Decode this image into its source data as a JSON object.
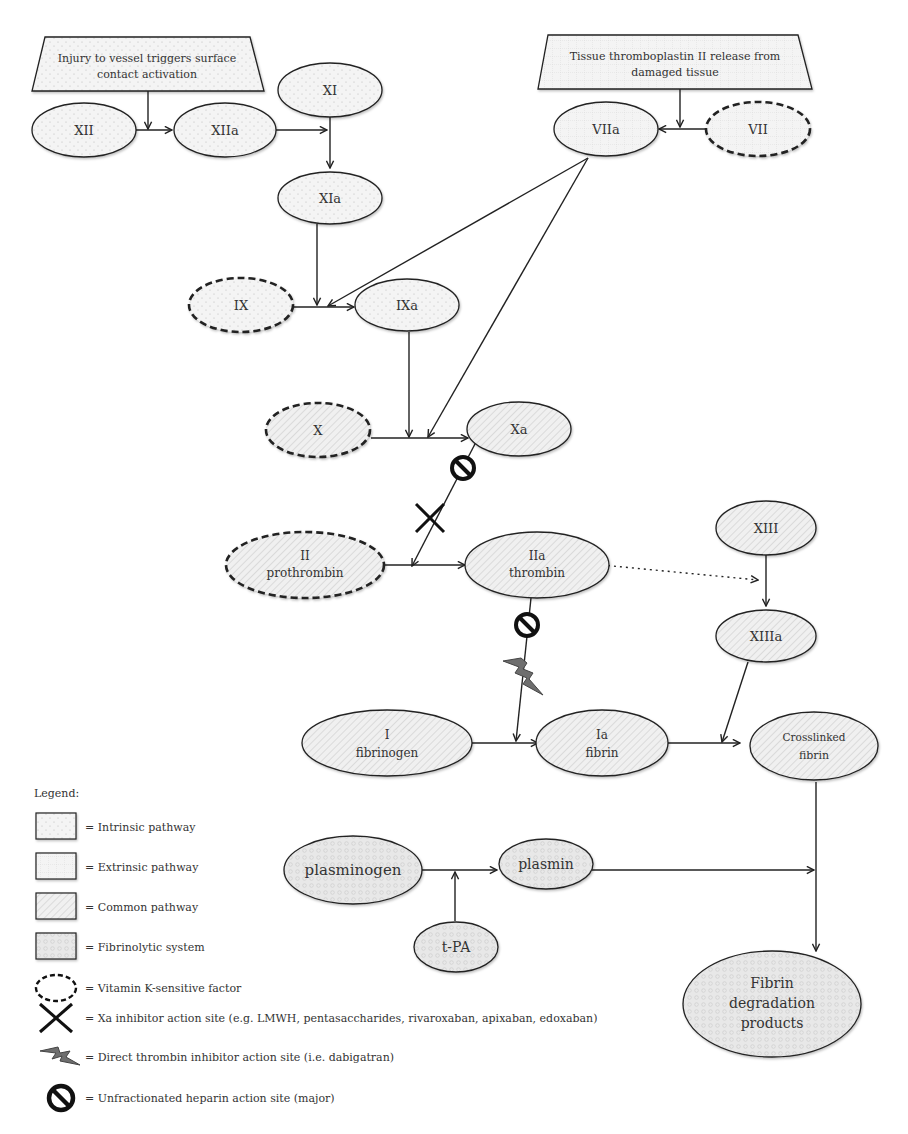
{
  "diagram": {
    "boxes": [
      {
        "id": "intrinsic-trigger",
        "pathway": "intrinsic",
        "lines": [
          "Injury to vessel triggers surface",
          "contact activation"
        ]
      },
      {
        "id": "extrinsic-trigger",
        "pathway": "extrinsic",
        "lines": [
          "Tissue thromboplastin II release from",
          "damaged tissue"
        ]
      }
    ],
    "nodes": [
      {
        "id": "XII",
        "lines": [
          "XII"
        ],
        "pathway": "intrinsic",
        "vitamin_k": false
      },
      {
        "id": "XIIa",
        "lines": [
          "XIIa"
        ],
        "pathway": "intrinsic",
        "vitamin_k": false
      },
      {
        "id": "XI",
        "lines": [
          "XI"
        ],
        "pathway": "intrinsic",
        "vitamin_k": false
      },
      {
        "id": "XIa",
        "lines": [
          "XIa"
        ],
        "pathway": "intrinsic",
        "vitamin_k": false
      },
      {
        "id": "IX",
        "lines": [
          "IX"
        ],
        "pathway": "intrinsic",
        "vitamin_k": true
      },
      {
        "id": "IXa",
        "lines": [
          "IXa"
        ],
        "pathway": "intrinsic",
        "vitamin_k": false
      },
      {
        "id": "VIIa",
        "lines": [
          "VIIa"
        ],
        "pathway": "extrinsic",
        "vitamin_k": false
      },
      {
        "id": "VII",
        "lines": [
          "VII"
        ],
        "pathway": "extrinsic",
        "vitamin_k": true
      },
      {
        "id": "X",
        "lines": [
          "X"
        ],
        "pathway": "common",
        "vitamin_k": true
      },
      {
        "id": "Xa",
        "lines": [
          "Xa"
        ],
        "pathway": "common",
        "vitamin_k": false
      },
      {
        "id": "II",
        "lines": [
          "II",
          "prothrombin"
        ],
        "pathway": "common",
        "vitamin_k": true
      },
      {
        "id": "IIa",
        "lines": [
          "IIa",
          "thrombin"
        ],
        "pathway": "common",
        "vitamin_k": false
      },
      {
        "id": "XIII",
        "lines": [
          "XIII"
        ],
        "pathway": "common",
        "vitamin_k": false
      },
      {
        "id": "XIIIa",
        "lines": [
          "XIIIa"
        ],
        "pathway": "common",
        "vitamin_k": false
      },
      {
        "id": "I",
        "lines": [
          "I",
          "fibrinogen"
        ],
        "pathway": "common",
        "vitamin_k": false
      },
      {
        "id": "Ia",
        "lines": [
          "Ia",
          "fibrin"
        ],
        "pathway": "common",
        "vitamin_k": false
      },
      {
        "id": "crosslinked",
        "lines": [
          "Crosslinked",
          "fibrin"
        ],
        "pathway": "common",
        "vitamin_k": false
      },
      {
        "id": "plasminogen",
        "lines": [
          "plasminogen"
        ],
        "pathway": "fibrinolytic",
        "vitamin_k": false
      },
      {
        "id": "plasmin",
        "lines": [
          "plasmin"
        ],
        "pathway": "fibrinolytic",
        "vitamin_k": false
      },
      {
        "id": "tPA",
        "lines": [
          "t-PA"
        ],
        "pathway": "fibrinolytic",
        "vitamin_k": false
      },
      {
        "id": "FDP",
        "lines": [
          "Fibrin",
          "degradation",
          "products"
        ],
        "pathway": "fibrinolytic",
        "vitamin_k": false
      }
    ],
    "edges": [
      {
        "from": "XII",
        "to": "XIIa",
        "via": "intrinsic-trigger"
      },
      {
        "from": "XIIa",
        "to": "XI→XIa"
      },
      {
        "from": "XI",
        "to": "XIa"
      },
      {
        "from": "XIa",
        "to": "IX→IXa"
      },
      {
        "from": "VIIa",
        "to": "IX→IXa"
      },
      {
        "from": "IX",
        "to": "IXa"
      },
      {
        "from": "VII",
        "to": "VIIa",
        "via": "extrinsic-trigger"
      },
      {
        "from": "IXa",
        "to": "X→Xa"
      },
      {
        "from": "VIIa",
        "to": "X→Xa"
      },
      {
        "from": "X",
        "to": "Xa"
      },
      {
        "from": "Xa",
        "to": "II→IIa",
        "inhibitors": [
          "unfractionated-heparin",
          "xa-inhibitor"
        ]
      },
      {
        "from": "II",
        "to": "IIa"
      },
      {
        "from": "IIa",
        "to": "XIII→XIIIa",
        "style": "dotted"
      },
      {
        "from": "XIII",
        "to": "XIIIa"
      },
      {
        "from": "IIa",
        "to": "I→Ia",
        "inhibitors": [
          "unfractionated-heparin",
          "direct-thrombin-inhibitor"
        ]
      },
      {
        "from": "I",
        "to": "Ia"
      },
      {
        "from": "XIIIa",
        "to": "Ia→crosslinked"
      },
      {
        "from": "Ia",
        "to": "crosslinked"
      },
      {
        "from": "plasminogen",
        "to": "plasmin"
      },
      {
        "from": "tPA",
        "to": "plasminogen→plasmin"
      },
      {
        "from": "plasmin",
        "to": "crosslinked→FDP"
      },
      {
        "from": "crosslinked",
        "to": "FDP"
      }
    ]
  },
  "legend": {
    "title": "Legend:",
    "items": [
      {
        "symbol": "intrinsic-swatch",
        "label": "= Intrinsic pathway"
      },
      {
        "symbol": "extrinsic-swatch",
        "label": "= Extrinsic pathway"
      },
      {
        "symbol": "common-swatch",
        "label": "= Common pathway"
      },
      {
        "symbol": "fibrinolytic-swatch",
        "label": "=  Fibrinolytic system"
      },
      {
        "symbol": "dashed-ellipse",
        "label": "= Vitamin K-sensitive factor"
      },
      {
        "symbol": "x-mark",
        "label": "= Xa inhibitor action site (e.g. LMWH, pentasaccharides, rivaroxaban, apixaban, edoxaban)"
      },
      {
        "symbol": "lightning",
        "label": "= Direct thrombin inhibitor action site (i.e. dabigatran)"
      },
      {
        "symbol": "prohibition",
        "label": "= Unfractionated heparin action site (major)"
      }
    ]
  },
  "colors": {
    "stroke": "#222222",
    "fill": "#f2f2f2",
    "text": "#333333",
    "lightning": "#6e6e6e"
  }
}
